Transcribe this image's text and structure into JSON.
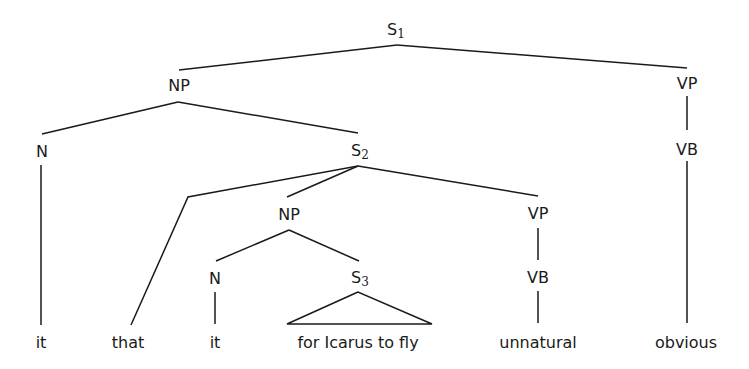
{
  "diagram": {
    "type": "syntax-tree",
    "nodes": {
      "s1": {
        "label": "S",
        "sub": "1"
      },
      "np1": {
        "label": "NP"
      },
      "vp1": {
        "label": "VP"
      },
      "n1": {
        "label": "N"
      },
      "s2": {
        "label": "S",
        "sub": "2"
      },
      "vb1": {
        "label": "VB"
      },
      "np2": {
        "label": "NP"
      },
      "vp2": {
        "label": "VP"
      },
      "n2": {
        "label": "N"
      },
      "s3": {
        "label": "S",
        "sub": "3"
      },
      "vb2": {
        "label": "VB"
      }
    },
    "words": [
      "it",
      "that",
      "it",
      "for Icarus to fly",
      "unnatural",
      "obvious"
    ],
    "line_color": "#1a1a1a"
  }
}
